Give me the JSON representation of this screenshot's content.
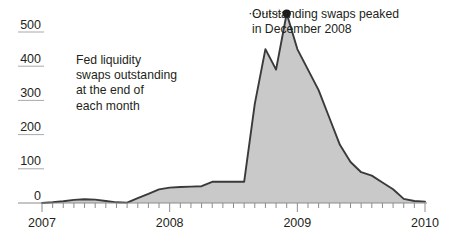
{
  "chart_data": {
    "type": "area",
    "title": "",
    "subtitle": "",
    "xlabel": "",
    "ylabel": "",
    "caption": {
      "lines": [
        "Fed liquidity",
        "swaps outstanding",
        "at the end of",
        "each month"
      ]
    },
    "annotation": {
      "lines": [
        "Outstanding swaps peaked",
        "in December 2008"
      ],
      "point_x": "2008-12",
      "point_y": 554,
      "leader": "dotted"
    },
    "grid": true,
    "legend": "none",
    "xlim": [
      "2007-01",
      "2010-01"
    ],
    "ylim": [
      0,
      600
    ],
    "xtick_labels": [
      "2007",
      "2008",
      "2009",
      "2010"
    ],
    "xtick_values": [
      "2007-01",
      "2008-01",
      "2009-01",
      "2010-01"
    ],
    "ytick_labels": [
      "0",
      "100",
      "200",
      "300",
      "400",
      "500"
    ],
    "ytick_values": [
      0,
      100,
      200,
      300,
      400,
      500
    ],
    "minor_xticks": "monthly",
    "units": "billions of U.S. dollars",
    "series": [
      {
        "name": "Fed liquidity swaps outstanding",
        "fill_color": "#c9c9c9",
        "line_color": "#3a3a3a",
        "x": [
          "2007-01",
          "2007-02",
          "2007-03",
          "2007-04",
          "2007-05",
          "2007-06",
          "2007-07",
          "2007-08",
          "2007-09",
          "2007-10",
          "2007-11",
          "2007-12",
          "2008-01",
          "2008-02",
          "2008-03",
          "2008-04",
          "2008-05",
          "2008-06",
          "2008-07",
          "2008-08",
          "2008-09",
          "2008-10",
          "2008-11",
          "2008-12",
          "2009-01",
          "2009-02",
          "2009-03",
          "2009-04",
          "2009-05",
          "2009-06",
          "2009-07",
          "2009-08",
          "2009-09",
          "2009-10",
          "2009-11",
          "2009-12",
          "2010-01"
        ],
        "values": [
          0,
          2,
          5,
          9,
          11,
          10,
          6,
          2,
          1,
          14,
          27,
          40,
          45,
          47,
          48,
          49,
          62,
          62,
          62,
          62,
          290,
          450,
          390,
          554,
          450,
          390,
          330,
          250,
          170,
          120,
          90,
          80,
          60,
          40,
          12,
          6,
          4
        ]
      }
    ]
  },
  "axis": {
    "zero_line_label": "0",
    "top_gridline_value": 600
  }
}
